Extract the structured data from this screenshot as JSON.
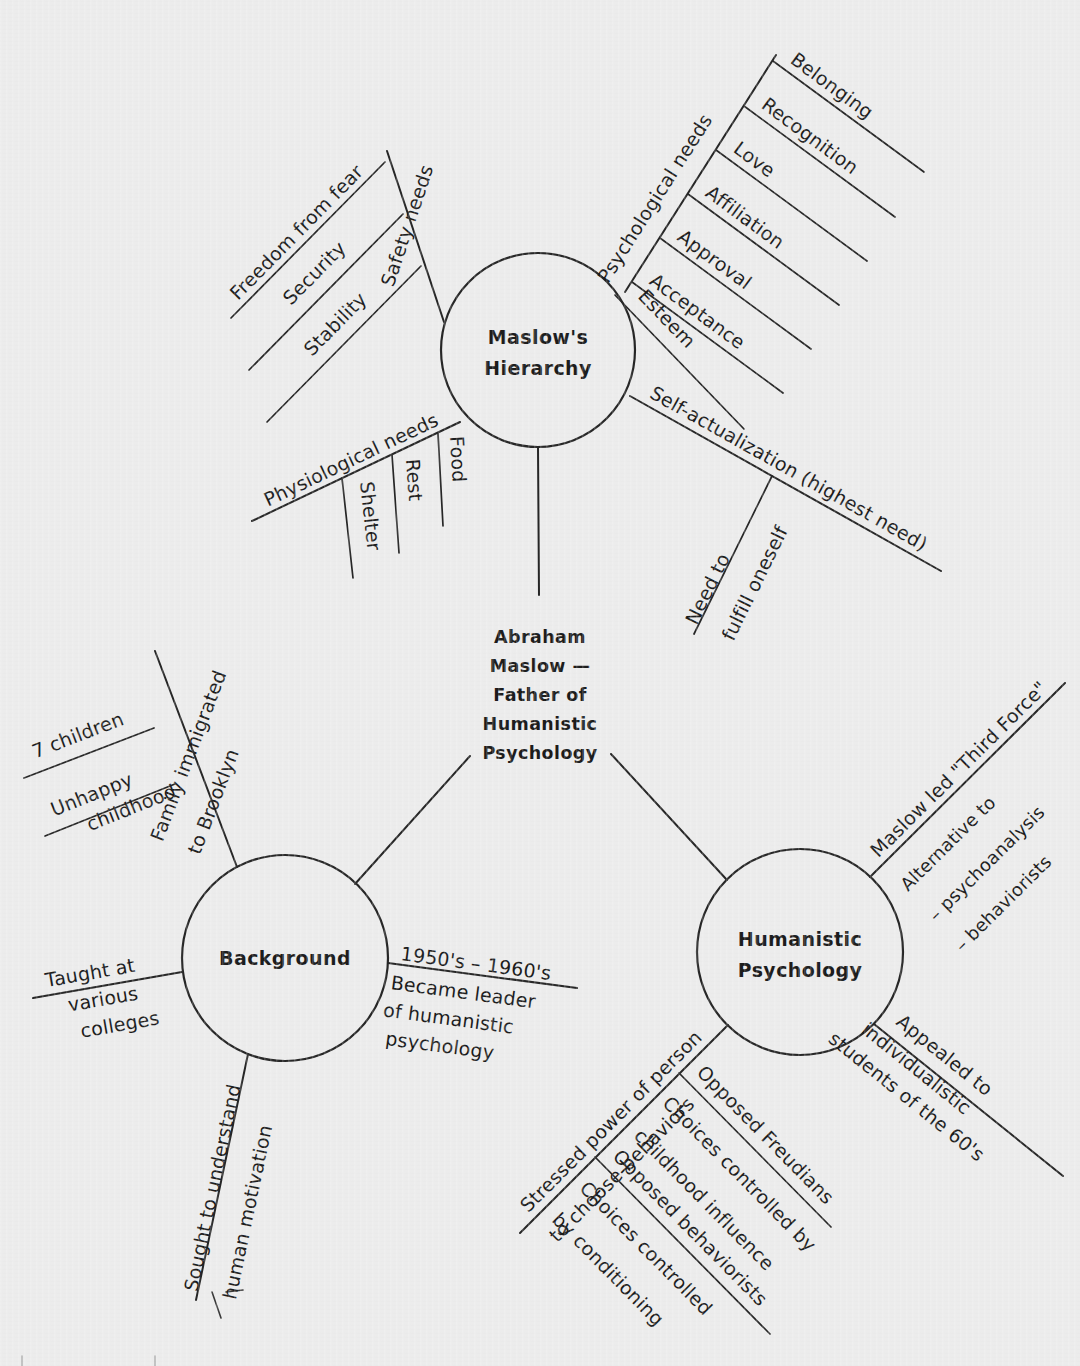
{
  "diagram": {
    "type": "mind-map",
    "title": "Abraham Maslow — Father of Humanistic Psychology",
    "background_color": "#ececec",
    "ink_color": "#1c1c1c"
  },
  "center": {
    "id": "center-node",
    "lines": [
      "Abraham",
      "Maslow —",
      "Father of",
      "Humanistic",
      "Psychology"
    ]
  },
  "nodes": {
    "maslows_hierarchy": {
      "lines": [
        "Maslow's",
        "Hierarchy"
      ]
    },
    "background": {
      "lines": [
        "Background"
      ]
    },
    "humanistic_psychology": {
      "lines": [
        "Humanistic",
        "Psychology"
      ]
    }
  },
  "branches": {
    "safety_needs": {
      "label": "Safety needs",
      "children": [
        {
          "label": "Freedom from fear"
        },
        {
          "label": "Security"
        },
        {
          "label": "Stability"
        }
      ]
    },
    "psychological_needs": {
      "label": "Psychological needs",
      "children": [
        {
          "label": "Belonging"
        },
        {
          "label": "Recognition"
        },
        {
          "label": "Love"
        },
        {
          "label": "Affiliation"
        },
        {
          "label": "Approval"
        },
        {
          "label": "Acceptance"
        },
        {
          "label": "Esteem"
        }
      ]
    },
    "physiological_needs": {
      "label": "Physiological needs",
      "children": [
        {
          "label": "Food"
        },
        {
          "label": "Rest"
        },
        {
          "label": "Shelter"
        }
      ]
    },
    "self_actualization": {
      "label": "Self-actualization (highest need)",
      "children": [
        {
          "label_line1": "Need to",
          "label_line2": "fulfill oneself"
        }
      ]
    },
    "family_immigrated": {
      "label_line1": "Family immigrated",
      "label_line2": "to Brooklyn",
      "children": [
        {
          "label": "7 children"
        },
        {
          "label_line1": "Unhappy",
          "label_line2": "childhood"
        }
      ]
    },
    "taught_at_colleges": {
      "label_line1": "Taught at",
      "label_line2": "various",
      "label_line3": "colleges"
    },
    "sought_to_understand": {
      "label_line1": "Sought to understand",
      "label_line2": "human motivation"
    },
    "became_leader": {
      "label_line1": "1950's – 1960's",
      "label_line2": "Became leader",
      "label_line3": "of humanistic",
      "label_line4": "psychology"
    },
    "third_force": {
      "label": "Maslow led \"Third Force\"",
      "children": [
        {
          "label": "Alternative to"
        },
        {
          "label": "– psychoanalysis"
        },
        {
          "label": "– behaviorists"
        }
      ]
    },
    "appealed_to_students": {
      "label_line1": "Appealed to",
      "label_line2": "individualistic",
      "label_line3": "students of the 60's"
    },
    "stressed_power": {
      "label_line1": "Stressed power of person",
      "label_line2": "to choose behaviors",
      "children": [
        {
          "label_line1": "Opposed Freudians",
          "label_line2": "Choices controlled by",
          "label_line3": "childhood influence"
        },
        {
          "label_line1": "Opposed behaviorists",
          "label_line2": "Choices controlled",
          "label_line3": "by conditioning"
        }
      ]
    }
  }
}
